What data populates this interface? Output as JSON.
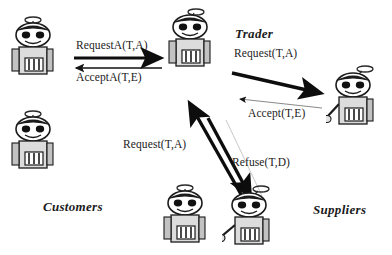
{
  "diagram": {
    "title_text": "",
    "roles": [
      {
        "id": "customers",
        "label": "Customers"
      },
      {
        "id": "trader",
        "label": "Trader"
      },
      {
        "id": "suppliers",
        "label": "Suppliers"
      }
    ],
    "messages": [
      {
        "id": "request-a",
        "label": "RequestA(T,A)",
        "from": "customer",
        "to": "trader",
        "style": "thick"
      },
      {
        "id": "accept-a",
        "label": "AcceptA(T,E)",
        "from": "trader",
        "to": "customer",
        "style": "thin"
      },
      {
        "id": "request",
        "label": "Request(T,A)",
        "from": "trader",
        "to": "supplier",
        "style": "thick"
      },
      {
        "id": "accept",
        "label": "Accept(T,E)",
        "from": "supplier",
        "to": "trader",
        "style": "thin"
      },
      {
        "id": "request-2",
        "label": "Request(T,A)",
        "from": "trader",
        "to": "supplier2",
        "style": "thick"
      },
      {
        "id": "refuse",
        "label": "Refuse(T,D)",
        "from": "supplier2",
        "to": "trader",
        "style": "thin"
      }
    ],
    "agents": [
      {
        "id": "customer-top",
        "role": "customers",
        "arm": "none"
      },
      {
        "id": "customer-bottom",
        "role": "customers",
        "arm": "none"
      },
      {
        "id": "trader-agent",
        "role": "trader",
        "arm": "none"
      },
      {
        "id": "supplier-right",
        "role": "suppliers",
        "arm": "left"
      },
      {
        "id": "supplier-mid",
        "role": "suppliers",
        "arm": "none"
      },
      {
        "id": "supplier-bottom",
        "role": "suppliers",
        "arm": "left"
      }
    ],
    "colors": {
      "ink": "#1b1b1b",
      "arrow_dark": "#0d0d0d",
      "arrow_light": "#6f6f6f",
      "robot_fill": "#d9d9d9",
      "robot_shade": "#9a9a9a",
      "background": "#ffffff"
    }
  }
}
